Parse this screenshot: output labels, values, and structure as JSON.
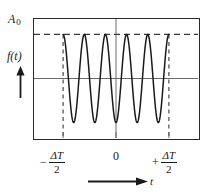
{
  "figure": {
    "type": "wave-train-diagram"
  },
  "labels": {
    "amplitude": "A",
    "amplitude_subscript": "0",
    "function": "f(t)",
    "origin": "0",
    "time_axis": "t",
    "left_sign": "−",
    "right_sign": "+",
    "fraction_numerator": "ΔT",
    "fraction_denominator": "2"
  },
  "icons": {
    "y_axis_arrow": "up-arrow-icon",
    "x_axis_arrow": "right-arrow-icon"
  },
  "colors": {
    "frame": "#2a2a2a",
    "curve": "#1a1a1a",
    "axis": "#6a6a6a",
    "dashed": "#3a3a3a",
    "background": "#ffffff"
  },
  "chart_data": {
    "type": "line",
    "title": "",
    "xlabel": "t",
    "ylabel": "f(t)",
    "xlim": [
      -1.55,
      1.55
    ],
    "ylim": [
      -1.35,
      1.35
    ],
    "grid": false,
    "legend": null,
    "annotations": [
      {
        "text": "A 0",
        "kind": "amplitude-level",
        "y": 1.0
      },
      {
        "text": "f(t)",
        "kind": "y-axis-label"
      },
      {
        "text": "0",
        "kind": "x-tick",
        "x": 0
      },
      {
        "text": "− ΔT/2",
        "kind": "x-tick",
        "x": -1.0
      },
      {
        "text": "+ ΔT/2",
        "kind": "x-tick",
        "x": 1.0
      },
      {
        "text": "t",
        "kind": "x-axis-label"
      }
    ],
    "reference_lines": [
      {
        "kind": "horizontal-dashed",
        "y": 1.0,
        "label": "A 0"
      },
      {
        "kind": "horizontal-solid",
        "y": 0.0,
        "label": ""
      },
      {
        "kind": "vertical-solid",
        "x": 0.0,
        "label": "0"
      },
      {
        "kind": "vertical-dashed",
        "x": -1.0,
        "label": "− ΔT/2"
      },
      {
        "kind": "vertical-dashed",
        "x": 1.0,
        "label": "+ ΔT/2"
      }
    ],
    "series": [
      {
        "name": "f(t)",
        "formula": "A0 * cos(2*pi*5*t/(2)) for |t| <= delta_T/2, else 0",
        "amplitude": 1.0,
        "cycles_in_train": 5,
        "x_start": -1.0,
        "x_end": 1.0,
        "peaks_x": [
          -1.0,
          -0.6,
          -0.2,
          0.2,
          0.6,
          1.0
        ],
        "peaks_y": [
          1.0,
          1.0,
          1.0,
          1.0,
          1.0,
          1.0
        ],
        "troughs_x": [
          -0.8,
          -0.4,
          0.0,
          0.4,
          0.8
        ],
        "troughs_y": [
          -1.0,
          -1.0,
          -1.0,
          -1.0,
          -1.0
        ]
      }
    ]
  }
}
